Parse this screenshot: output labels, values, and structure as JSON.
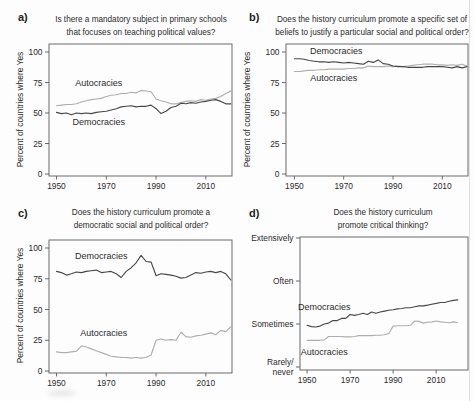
{
  "figure": {
    "background": "#fdfdfd",
    "panels": [
      "a",
      "b",
      "c",
      "d"
    ]
  },
  "colors": {
    "democracies": "#474747",
    "autocracies": "#aeaeae",
    "axis": "#5a5a5a",
    "text": "#2b2b2b"
  },
  "chart_data": [
    {
      "id": "a",
      "panel_label": "a)",
      "title": "Is there a mandatory subject in primary schools that focuses on teaching political values?",
      "title_lines": [
        "Is there a mandatory subject in primary schools",
        "that focuses on teaching political values?"
      ],
      "type": "line",
      "ylabel": "Percent of countries where Yes",
      "xlabel": "",
      "ylim": [
        0,
        100
      ],
      "yticks": [
        0,
        25,
        50,
        75,
        100
      ],
      "ytick_labels": [
        "0",
        "25",
        "50",
        "75",
        "100"
      ],
      "xlim": [
        1947,
        2020.5
      ],
      "xticks": [
        1950,
        1970,
        1990,
        2010
      ],
      "xtick_labels": [
        "1950",
        "1970",
        "1990",
        "2010"
      ],
      "grid": false,
      "legend": "inline-labels",
      "x_start": 1950,
      "x_step": 2,
      "series": [
        {
          "name": "Autocracies",
          "color_key": "autocracies",
          "label_at": {
            "x": 1967,
            "y": 75
          },
          "values": [
            56,
            56.5,
            57,
            57,
            57.5,
            59,
            60,
            61,
            61.5,
            62,
            63.5,
            64.5,
            65,
            66,
            66,
            67,
            66.5,
            68.5,
            68,
            67.5,
            61.5,
            60,
            59,
            57.5,
            57.5,
            58.5,
            59.5,
            60,
            59.5,
            61,
            60.5,
            61.5,
            62,
            63.5,
            66,
            68
          ]
        },
        {
          "name": "Democracies",
          "color_key": "democracies",
          "label_at": {
            "x": 1967,
            "y": 43
          },
          "values": [
            50.5,
            49.5,
            50,
            48.5,
            50,
            49.5,
            50,
            49.5,
            50.5,
            51,
            51.5,
            52.5,
            53.5,
            55,
            55.5,
            56,
            55,
            55.5,
            55.5,
            56.5,
            53.5,
            49.5,
            51.5,
            54.5,
            55.5,
            58,
            57.5,
            58.5,
            58,
            59,
            59.5,
            60.5,
            61,
            59.5,
            57.5,
            57.5
          ]
        }
      ]
    },
    {
      "id": "b",
      "panel_label": "b)",
      "title": "Does the history curriculum promote a specific set of beliefs to justify a particular social and political order?",
      "title_lines": [
        "Does the history curriculum promote a specific set of",
        "beliefs to justify a particular social and political order?"
      ],
      "type": "line",
      "ylabel": "Percent of countries where Yes",
      "xlabel": "",
      "ylim": [
        0,
        100
      ],
      "yticks": [
        0,
        25,
        50,
        75,
        100
      ],
      "ytick_labels": [
        "0",
        "25",
        "50",
        "75",
        "100"
      ],
      "xlim": [
        1946.6,
        2020.4
      ],
      "xticks": [
        1950,
        1970,
        1990,
        2010
      ],
      "xtick_labels": [
        "1950",
        "1970",
        "1990",
        "2010"
      ],
      "grid": false,
      "legend": "inline-labels",
      "x_start": 1950,
      "x_step": 2,
      "series": [
        {
          "name": "Autocracies",
          "color_key": "autocracies",
          "label_at": {
            "x": 1966,
            "y": 78.5
          },
          "values": [
            84,
            84,
            84.5,
            85,
            85,
            85.5,
            85.5,
            86,
            86,
            86,
            86,
            86.5,
            86.5,
            87,
            87,
            88.5,
            88,
            88,
            88,
            88.5,
            88,
            88.5,
            88,
            88.5,
            89,
            89.5,
            90,
            90,
            90,
            89.5,
            89.5,
            89,
            89.5,
            89,
            90,
            88.5
          ]
        },
        {
          "name": "Democracies",
          "color_key": "democracies",
          "label_at": {
            "x": 1967,
            "y": 100.5
          },
          "values": [
            94.5,
            94.5,
            94,
            93,
            92.5,
            92,
            92,
            91.5,
            92,
            91.5,
            91,
            91.5,
            91,
            90.5,
            90,
            92.5,
            91.5,
            93.5,
            90.5,
            90,
            88.5,
            88,
            88,
            87.5,
            87.5,
            87.5,
            87.5,
            88,
            88,
            88,
            88,
            87.5,
            87,
            88,
            87,
            88
          ]
        }
      ]
    },
    {
      "id": "c",
      "panel_label": "c)",
      "title": "Does the history curriculum promote a democratic social and political order?",
      "title_lines": [
        "Does the history curriculum promote a",
        "democratic social and political order?"
      ],
      "type": "line",
      "ylabel": "Percent of countries where Yes",
      "xlabel": "",
      "ylim": [
        0,
        100
      ],
      "yticks": [
        0,
        25,
        50,
        75,
        100
      ],
      "ytick_labels": [
        "0",
        "25",
        "50",
        "75",
        "100"
      ],
      "xlim": [
        1947,
        2020.5
      ],
      "xticks": [
        1950,
        1970,
        1990,
        2010
      ],
      "xtick_labels": [
        "1950",
        "1970",
        "1990",
        "2010"
      ],
      "grid": false,
      "legend": "inline-labels",
      "x_start": 1950,
      "x_step": 2,
      "series": [
        {
          "name": "Autocracies",
          "color_key": "autocracies",
          "label_at": {
            "x": 1969,
            "y": 31
          },
          "values": [
            15.5,
            15,
            15,
            15.5,
            16,
            20.5,
            19.5,
            18,
            16.5,
            15,
            13.5,
            12,
            11.5,
            11,
            11,
            10.5,
            11,
            10.5,
            11,
            13,
            25,
            26,
            25,
            25.5,
            25,
            31.5,
            28,
            27.5,
            28.5,
            29,
            30,
            31,
            29.5,
            33,
            32,
            36
          ]
        },
        {
          "name": "Democracies",
          "color_key": "democracies",
          "label_at": {
            "x": 1968,
            "y": 93.5
          },
          "values": [
            81,
            80,
            78,
            79,
            80.5,
            80,
            81,
            81.5,
            82,
            80,
            80.5,
            81,
            79,
            76,
            81,
            84,
            88,
            94,
            89,
            88.5,
            77.5,
            79,
            78.5,
            78,
            77,
            75.5,
            76,
            78,
            80,
            79.5,
            80.5,
            81,
            80,
            81,
            79,
            74
          ]
        }
      ]
    },
    {
      "id": "d",
      "panel_label": "d)",
      "title": "Does the history curriculum promote critical thinking?",
      "title_lines": [
        "Does the history curriculum",
        "promote critical thinking?"
      ],
      "type": "line",
      "ylabel": "",
      "xlabel": "",
      "ylim": [
        0,
        3
      ],
      "yticks": [
        0,
        1,
        2,
        3
      ],
      "ytick_labels": [
        "Rarely/\nnever",
        "Sometimes",
        "Often",
        "Extensively"
      ],
      "xlim": [
        1946.7,
        2024.8
      ],
      "xticks": [
        1950,
        1970,
        1990,
        2010
      ],
      "xtick_labels": [
        "1950",
        "1970",
        "1990",
        "2010"
      ],
      "grid": false,
      "legend": "inline-labels",
      "x_start": 1950,
      "x_step": 2,
      "series": [
        {
          "name": "Autocracies",
          "color_key": "autocracies",
          "label_at": {
            "x": 1958,
            "y": 0.35
          },
          "values": [
            0.62,
            0.62,
            0.62,
            0.62,
            0.63,
            0.71,
            0.71,
            0.71,
            0.71,
            0.7,
            0.7,
            0.71,
            0.73,
            0.73,
            0.73,
            0.73,
            0.74,
            0.74,
            0.75,
            0.78,
            0.95,
            0.96,
            0.96,
            0.96,
            0.97,
            1.07,
            1.06,
            1.02,
            1.04,
            1.05,
            1.07,
            1.05,
            1.04,
            1.03,
            1.05,
            1.03
          ]
        },
        {
          "name": "Democracies",
          "color_key": "democracies",
          "label_at": {
            "x": 1958,
            "y": 1.4
          },
          "values": [
            0.97,
            0.94,
            0.93,
            0.95,
            1.0,
            1.02,
            1.08,
            1.08,
            1.13,
            1.13,
            1.22,
            1.2,
            1.22,
            1.25,
            1.22,
            1.28,
            1.25,
            1.28,
            1.3,
            1.32,
            1.33,
            1.35,
            1.36,
            1.38,
            1.38,
            1.4,
            1.42,
            1.42,
            1.44,
            1.46,
            1.48,
            1.5,
            1.5,
            1.53,
            1.55,
            1.56
          ]
        }
      ]
    }
  ]
}
